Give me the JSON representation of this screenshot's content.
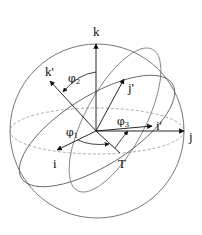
{
  "diagram": {
    "labels": {
      "k": "k",
      "k_prime": "k'",
      "j": "j",
      "j_prime": "j'",
      "i": "i",
      "i_prime": "i'",
      "T": "T",
      "phi1": "φ",
      "phi1_sub": "1",
      "phi2": "φ",
      "phi2_sub": "2",
      "phi3": "φ",
      "phi3_sub": "3"
    },
    "colors": {
      "stroke": "#222222",
      "sphere": "#555555",
      "dashed": "#888888",
      "background": "#ffffff"
    }
  }
}
